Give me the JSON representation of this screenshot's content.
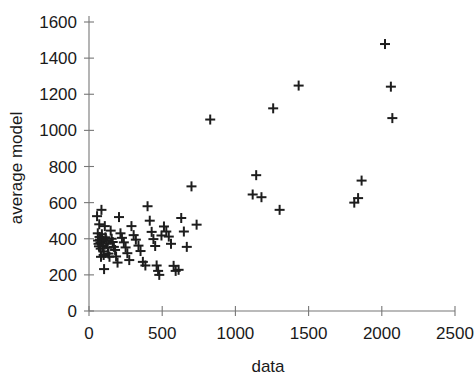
{
  "chart_data": {
    "type": "scatter",
    "title": "",
    "xlabel": "data",
    "ylabel": "average model",
    "xlim": [
      0,
      2500
    ],
    "ylim": [
      0,
      1600
    ],
    "xticks": [
      0,
      500,
      1000,
      1500,
      2000,
      2500
    ],
    "yticks": [
      0,
      200,
      400,
      600,
      800,
      1000,
      1200,
      1400,
      1600
    ],
    "grid": false,
    "legend": null,
    "marker": "plus",
    "marker_color": "#1d1d1d",
    "series": [
      {
        "name": "average model vs data",
        "points": [
          [
            55,
            525
          ],
          [
            60,
            430
          ],
          [
            62,
            390
          ],
          [
            65,
            372
          ],
          [
            68,
            358
          ],
          [
            70,
            480
          ],
          [
            72,
            410
          ],
          [
            75,
            395
          ],
          [
            78,
            380
          ],
          [
            80,
            345
          ],
          [
            82,
            300
          ],
          [
            85,
            560
          ],
          [
            88,
            425
          ],
          [
            90,
            400
          ],
          [
            92,
            385
          ],
          [
            95,
            360
          ],
          [
            98,
            330
          ],
          [
            100,
            310
          ],
          [
            103,
            232
          ],
          [
            108,
            470
          ],
          [
            112,
            408
          ],
          [
            118,
            392
          ],
          [
            122,
            372
          ],
          [
            128,
            350
          ],
          [
            133,
            318
          ],
          [
            140,
            300
          ],
          [
            148,
            445
          ],
          [
            155,
            400
          ],
          [
            162,
            382
          ],
          [
            170,
            355
          ],
          [
            178,
            338
          ],
          [
            185,
            302
          ],
          [
            195,
            268
          ],
          [
            205,
            520
          ],
          [
            215,
            430
          ],
          [
            225,
            405
          ],
          [
            238,
            380
          ],
          [
            250,
            352
          ],
          [
            262,
            320
          ],
          [
            275,
            282
          ],
          [
            290,
            470
          ],
          [
            305,
            420
          ],
          [
            320,
            395
          ],
          [
            338,
            362
          ],
          [
            352,
            332
          ],
          [
            368,
            272
          ],
          [
            385,
            252
          ],
          [
            400,
            580
          ],
          [
            415,
            500
          ],
          [
            428,
            438
          ],
          [
            440,
            398
          ],
          [
            452,
            360
          ],
          [
            462,
            252
          ],
          [
            472,
            222
          ],
          [
            480,
            200
          ],
          [
            495,
            418
          ],
          [
            512,
            468
          ],
          [
            528,
            440
          ],
          [
            545,
            412
          ],
          [
            560,
            372
          ],
          [
            578,
            250
          ],
          [
            592,
            222
          ],
          [
            612,
            228
          ],
          [
            630,
            515
          ],
          [
            648,
            440
          ],
          [
            668,
            355
          ],
          [
            700,
            690
          ],
          [
            735,
            478
          ],
          [
            828,
            1060
          ],
          [
            1118,
            645
          ],
          [
            1142,
            752
          ],
          [
            1178,
            630
          ],
          [
            1258,
            1122
          ],
          [
            1302,
            560
          ],
          [
            1432,
            1248
          ],
          [
            1812,
            600
          ],
          [
            1838,
            625
          ],
          [
            1862,
            722
          ],
          [
            2022,
            1478
          ],
          [
            2062,
            1242
          ],
          [
            2072,
            1068
          ]
        ]
      }
    ]
  },
  "axes": {
    "x_tick_labels": [
      "0",
      "500",
      "1000",
      "1500",
      "2000",
      "2500"
    ],
    "y_tick_labels": [
      "0",
      "200",
      "400",
      "600",
      "800",
      "1000",
      "1200",
      "1400",
      "1600"
    ],
    "x_axis_title": "data",
    "y_axis_title": "average model"
  }
}
